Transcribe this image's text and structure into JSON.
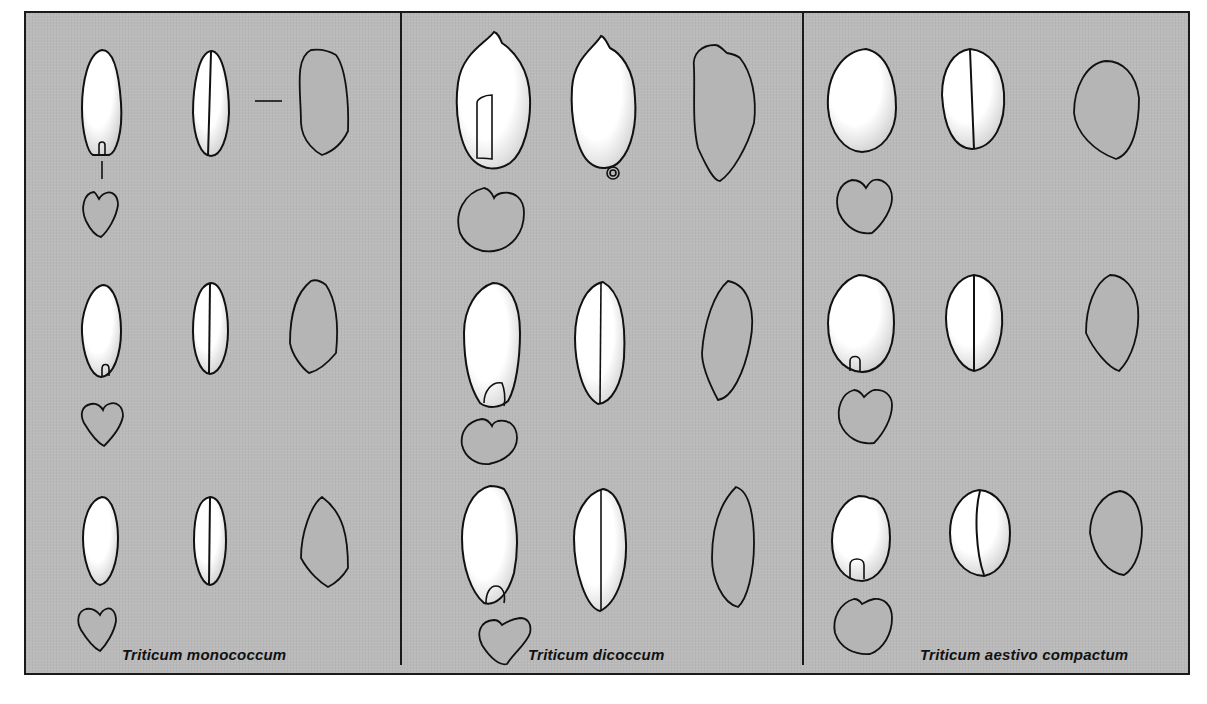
{
  "figure": {
    "background_color": "#bababa",
    "line_color": "#1a1a1a",
    "panels": [
      {
        "id": "monococcum",
        "label": "Triticum monococcum",
        "rows": 3,
        "views_per_row": [
          "ventral",
          "dorsal",
          "lateral",
          "cross-section"
        ]
      },
      {
        "id": "dicoccum",
        "label": "Triticum dicoccum",
        "rows": 3,
        "views_per_row": [
          "ventral",
          "dorsal",
          "lateral",
          "cross-section"
        ]
      },
      {
        "id": "aestivo-compactum",
        "label": "Triticum aestivo compactum",
        "rows": 3,
        "views_per_row": [
          "ventral",
          "dorsal",
          "lateral",
          "cross-section"
        ]
      }
    ]
  }
}
